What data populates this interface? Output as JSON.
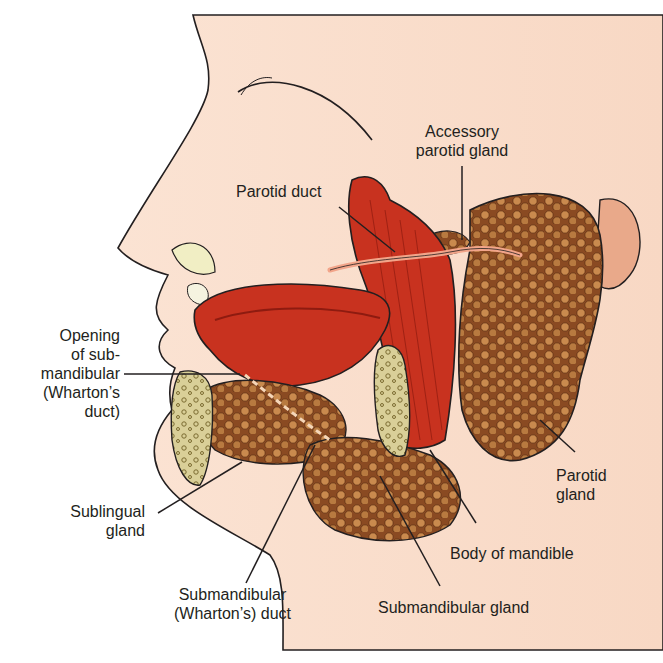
{
  "diagram": {
    "colors": {
      "skin": "#f9dccb",
      "skin_edge": "#f4c4a8",
      "muscle": "#c8321f",
      "muscle_dark": "#8e1b10",
      "gland": "#8a4a22",
      "gland_light": "#c98a4e",
      "bone": "#e8dfb0",
      "outline": "#231f20"
    },
    "labels": {
      "accessory_parotid": [
        "Accessory",
        "parotid gland"
      ],
      "parotid_duct": "Parotid duct",
      "opening_submandibular": [
        "Opening",
        "of sub-",
        "mandibular",
        "(Wharton’s",
        "duct)"
      ],
      "sublingual_gland": [
        "Sublingual",
        "gland"
      ],
      "parotid_gland": [
        "Parotid",
        "gland"
      ],
      "body_of_mandible": "Body of mandible",
      "submandibular_duct": [
        "Submandibular",
        "(Wharton’s) duct"
      ],
      "submandibular_gland": "Submandibular gland"
    }
  }
}
